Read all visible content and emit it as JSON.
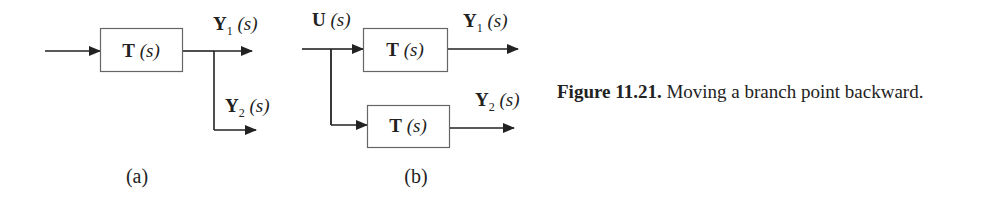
{
  "diagram_a": {
    "block_label": "T",
    "block_arg": "(s)",
    "output1": {
      "var": "Y",
      "sub": "1",
      "arg": "(s)"
    },
    "output2": {
      "var": "Y",
      "sub": "2",
      "arg": "(s)"
    },
    "sublabel": "(a)"
  },
  "diagram_b": {
    "input": {
      "var": "U",
      "arg": "(s)"
    },
    "block1_label": "T",
    "block1_arg": "(s)",
    "block2_label": "T",
    "block2_arg": "(s)",
    "output1": {
      "var": "Y",
      "sub": "1",
      "arg": "(s)"
    },
    "output2": {
      "var": "Y",
      "sub": "2",
      "arg": "(s)"
    },
    "sublabel": "(b)"
  },
  "caption": {
    "figure_number": "Figure 11.21.",
    "text": "Moving a branch point backward."
  },
  "colors": {
    "line": "#222222",
    "box_border": "#555555",
    "text": "#222222"
  }
}
